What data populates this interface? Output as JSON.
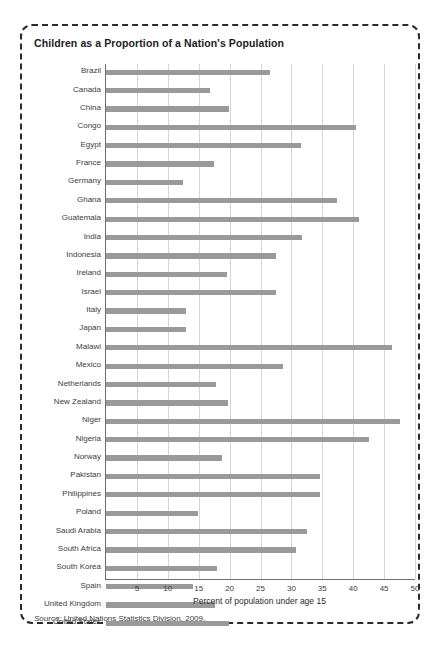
{
  "figure": {
    "title": "Children as a Proportion of a Nation's Population",
    "source_label": "Source:",
    "source_text": "United Nations Statistics Division, 2009.",
    "bar_color": "#9a9a9a",
    "grid_color": "#d6d6d6",
    "axis_color": "#6f6f6f",
    "border_color": "#2b2b2b"
  },
  "chart_data": {
    "type": "bar",
    "orientation": "horizontal",
    "title": "Children as a Proportion of a Nation's Population",
    "xlabel": "Percent of population under age 15",
    "ylabel": "",
    "xlim": [
      0,
      50
    ],
    "xticks": [
      5,
      10,
      15,
      20,
      25,
      30,
      35,
      40,
      45,
      50
    ],
    "grid": true,
    "legend": false,
    "categories": [
      "Brazil",
      "Canada",
      "China",
      "Congo",
      "Egypt",
      "France",
      "Germany",
      "Ghana",
      "Guatemala",
      "India",
      "Indonesia",
      "Ireland",
      "Israel",
      "Italy",
      "Japan",
      "Malawi",
      "Mexico",
      "Netherlands",
      "New Zealand",
      "Niger",
      "Nigeria",
      "Norway",
      "Pakistan",
      "Philippines",
      "Poland",
      "Saudi Arabia",
      "South Africa",
      "South Korea",
      "Spain",
      "United Kingdom",
      "United States"
    ],
    "values": [
      26.5,
      16.8,
      19.9,
      40.5,
      31.6,
      17.5,
      12.5,
      37.3,
      41.0,
      31.7,
      27.5,
      19.6,
      27.5,
      12.9,
      12.9,
      46.3,
      28.7,
      17.8,
      19.8,
      47.6,
      42.6,
      18.8,
      34.6,
      34.6,
      14.9,
      32.6,
      30.8,
      17.9,
      14.0,
      17.7,
      19.9
    ]
  }
}
